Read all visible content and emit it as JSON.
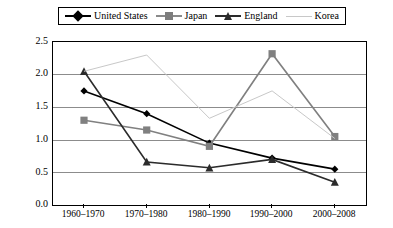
{
  "legend": {
    "position": "top",
    "entries": [
      {
        "label": "United States",
        "marker": "diamond",
        "color": "#000000",
        "line": "solid-thick"
      },
      {
        "label": "Japan",
        "marker": "square",
        "color": "#808080",
        "line": "solid-thick"
      },
      {
        "label": "England",
        "marker": "triangle",
        "color": "#2b2b2b",
        "line": "solid-thick"
      },
      {
        "label": "Korea",
        "marker": "none",
        "color": "#c8c8c8",
        "line": "solid-thin"
      }
    ]
  },
  "axes": {
    "y_ticks": [
      "2.5",
      "2.0",
      "1.5",
      "1.0",
      "0.5",
      "0.0"
    ],
    "x_ticks": [
      "1960–1970",
      "1970–1980",
      "1980–1990",
      "1990–2000",
      "2000–2008"
    ]
  },
  "chart_data": {
    "type": "line",
    "title": "",
    "xlabel": "",
    "ylabel": "",
    "ylim": [
      0.0,
      2.5
    ],
    "ytick_step": 0.5,
    "grid": true,
    "legend_position": "top",
    "categories": [
      "1960–1970",
      "1970–1980",
      "1980–1990",
      "1990–2000",
      "2000–2008"
    ],
    "series": [
      {
        "name": "United States",
        "marker": "diamond",
        "color": "#000000",
        "values": [
          1.75,
          1.4,
          0.95,
          0.72,
          0.55
        ]
      },
      {
        "name": "Japan",
        "marker": "square",
        "color": "#808080",
        "values": [
          1.3,
          1.15,
          0.9,
          2.32,
          1.05
        ]
      },
      {
        "name": "England",
        "marker": "triangle",
        "color": "#2b2b2b",
        "values": [
          2.05,
          0.66,
          0.57,
          0.7,
          0.35
        ]
      },
      {
        "name": "Korea",
        "marker": "none",
        "color": "#c8c8c8",
        "values": [
          2.05,
          2.3,
          1.33,
          1.75,
          1.02
        ]
      }
    ]
  }
}
